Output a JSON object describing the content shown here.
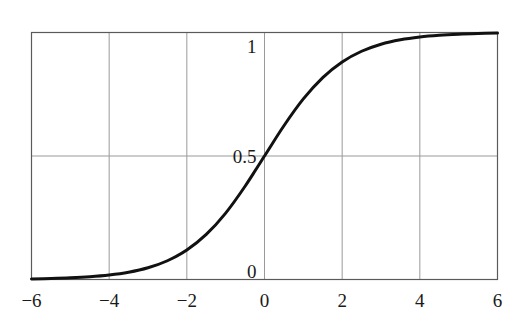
{
  "chart_data": {
    "type": "line",
    "title": "",
    "subtitle": "",
    "xlabel": "",
    "ylabel": "",
    "xlim": [
      -6,
      6
    ],
    "ylim": [
      0,
      1
    ],
    "grid": true,
    "legend": null,
    "legend_position": "none",
    "x_ticks": [
      -6,
      -4,
      -2,
      0,
      2,
      4,
      6
    ],
    "x_tick_labels": [
      "−6",
      "−4",
      "−2",
      "0",
      "2",
      "4",
      "6"
    ],
    "y_ticks": [
      0,
      0.5,
      1
    ],
    "y_tick_labels": [
      "0",
      "0.5",
      "1"
    ],
    "series": [
      {
        "name": "sigmoid",
        "formula": "1 / (1 + exp(-x))",
        "color": "#111111",
        "line_width": 3,
        "x": [
          -6,
          -5.5,
          -5,
          -4.5,
          -4,
          -3.5,
          -3,
          -2.5,
          -2,
          -1.5,
          -1,
          -0.5,
          0,
          0.5,
          1,
          1.5,
          2,
          2.5,
          3,
          3.5,
          4,
          4.5,
          5,
          5.5,
          6
        ],
        "values": [
          0.0025,
          0.0041,
          0.0067,
          0.011,
          0.018,
          0.0293,
          0.0474,
          0.0759,
          0.1192,
          0.1824,
          0.2689,
          0.3775,
          0.5,
          0.6225,
          0.7311,
          0.8176,
          0.8808,
          0.9241,
          0.9526,
          0.9707,
          0.982,
          0.989,
          0.9933,
          0.9959,
          0.9975
        ]
      }
    ],
    "annotations": [],
    "style": {
      "background": "#ffffff",
      "grid_color": "#9a9a9a",
      "axis_color": "#555555",
      "text_color": "#1a1a1a"
    }
  },
  "axis_labels": {
    "x": [
      {
        "value": -6,
        "text": "−6"
      },
      {
        "value": -4,
        "text": "−4"
      },
      {
        "value": -2,
        "text": "−2"
      },
      {
        "value": 0,
        "text": "0"
      },
      {
        "value": 2,
        "text": "2"
      },
      {
        "value": 4,
        "text": "4"
      },
      {
        "value": 6,
        "text": "6"
      }
    ],
    "y": [
      {
        "value": 1,
        "text": "1"
      },
      {
        "value": 0.5,
        "text": "0.5"
      },
      {
        "value": 0,
        "text": "0"
      }
    ]
  }
}
